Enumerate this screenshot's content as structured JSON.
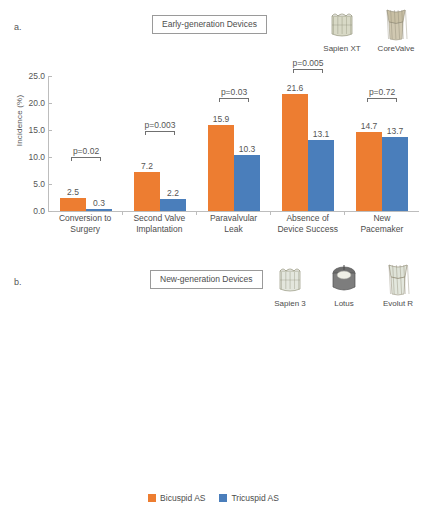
{
  "panel_a": {
    "letter": "a.",
    "title": "Early-generation Devices",
    "devices": [
      {
        "label": "Sapien XT",
        "icon": "sapien-xt-valve-icon"
      },
      {
        "label": "CoreValve",
        "icon": "corevalve-valve-icon"
      }
    ]
  },
  "panel_b": {
    "letter": "b.",
    "title": "New-generation Devices",
    "devices": [
      {
        "label": "Sapien 3",
        "icon": "sapien-3-valve-icon"
      },
      {
        "label": "Lotus",
        "icon": "lotus-valve-icon"
      },
      {
        "label": "Evolut R",
        "icon": "evolut-r-valve-icon"
      }
    ]
  },
  "legend": {
    "items": [
      {
        "label": "Bicuspid AS",
        "color": "#ED7D31"
      },
      {
        "label": "Tricuspid AS",
        "color": "#4A7EBB"
      }
    ]
  },
  "chart_data": [
    {
      "type": "bar",
      "title": "Early-generation Devices",
      "xlabel": "",
      "ylabel": "Incidence (%)",
      "ylim": [
        0,
        25
      ],
      "yticks": [
        "0.0",
        "5.0",
        "10.0",
        "15.0",
        "20.0",
        "25.0"
      ],
      "ytick_values": [
        0,
        5,
        10,
        15,
        20,
        25
      ],
      "grid": false,
      "legend_position": "bottom",
      "categories": [
        "Conversion to Surgery",
        "Second Valve Implantation",
        "Paravalvular Leak",
        "Absence of Device Success",
        "New Pacemaker"
      ],
      "category_lines": [
        [
          "Conversion to",
          "Surgery"
        ],
        [
          "Second Valve",
          "Implantation"
        ],
        [
          "Paravalvular",
          "Leak"
        ],
        [
          "Absence of",
          "Device Success"
        ],
        [
          "New",
          "Pacemaker"
        ]
      ],
      "series": [
        {
          "name": "Bicuspid AS",
          "color": "#ED7D31",
          "values": [
            2.5,
            7.2,
            15.9,
            21.6,
            14.7
          ],
          "labels": [
            "2.5",
            "7.2",
            "15.9",
            "21.6",
            "14.7"
          ]
        },
        {
          "name": "Tricuspid AS",
          "color": "#4A7EBB",
          "values": [
            0.3,
            2.2,
            10.3,
            13.1,
            13.7
          ],
          "labels": [
            "0.3",
            "2.2",
            "10.3",
            "13.1",
            "13.7"
          ]
        }
      ],
      "annotations": [
        {
          "text": "p=0.02",
          "category": "Conversion to Surgery",
          "y": 9.2
        },
        {
          "text": "p=0.003",
          "category": "Second Valve Implantation",
          "y": 14.0
        },
        {
          "text": "p=0.03",
          "category": "Paravalvular Leak",
          "y": 20.2
        },
        {
          "text": "p=0.005",
          "category": "Absence of Device Success",
          "y": 25.5
        },
        {
          "text": "p=0.72",
          "category": "New Pacemaker",
          "y": 20.2
        }
      ]
    },
    {
      "type": "bar",
      "title": "New-generation Devices",
      "xlabel": "",
      "ylabel": "Incidence (%)",
      "ylim": [
        0,
        25
      ],
      "yticks": [
        "0.0",
        "5.0",
        "10.0",
        "15.0",
        "20.0",
        "25.0"
      ],
      "ytick_values": [
        0,
        5,
        10,
        15,
        20,
        25
      ],
      "grid": false,
      "legend_position": "bottom",
      "categories": [
        "Conversion to Surgery",
        "Second Valve Implantation",
        "Paravalvular Leak",
        "Absence of Device Success",
        "New Pacemaker"
      ],
      "category_lines": [
        [
          "Conversion to",
          "Surgery"
        ],
        [
          "Second Valve",
          "Implantation"
        ],
        [
          "Paravalvular",
          "Leak"
        ],
        [
          "Absence of",
          "Device Success"
        ],
        [
          "New",
          "Pacemaker"
        ]
      ],
      "series": [
        {
          "name": "Bicuspid AS",
          "color": "#ED7D31",
          "values": [
            1.3,
            1.3,
            2.7,
            4.9,
            16.4
          ],
          "labels": [
            "1.3",
            "1.3",
            "2.7",
            "4.9",
            "16.4"
          ]
        },
        {
          "name": "Tricuspid AS",
          "color": "#4A7EBB",
          "values": [
            0.0,
            0.4,
            1.8,
            2.2,
            17.8
          ],
          "labels": [
            "0.0",
            "0.4",
            "1.8",
            "2.2",
            "17.8"
          ]
        }
      ],
      "annotations": [
        {
          "text": "p=0.25",
          "category": "Conversion to Surgery",
          "y": 11.0
        },
        {
          "text": "p=0.62",
          "category": "Second Valve Implantation",
          "y": 11.0
        },
        {
          "text": "p=0.53",
          "category": "Paravalvular Leak",
          "y": 11.0
        },
        {
          "text": "p=0.13",
          "category": "Absence of Device Success",
          "y": 11.0
        },
        {
          "text": "p=0.69",
          "category": "New Pacemaker",
          "y": 24.0
        }
      ]
    }
  ]
}
